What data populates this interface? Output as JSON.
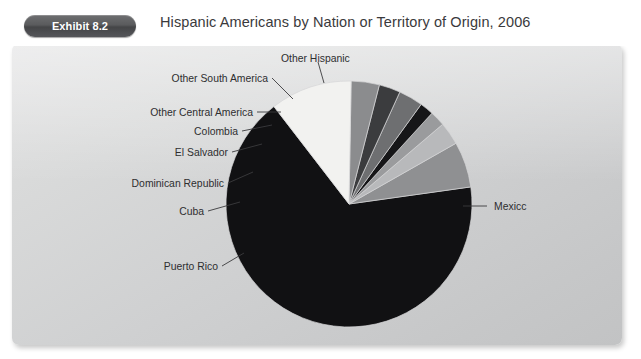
{
  "header": {
    "badge_label": "Exhibit 8.2",
    "title": "Hispanic Americans by Nation or Territory of Origin, 2006"
  },
  "labels": {
    "mexico": "Mexicc",
    "other_hispanic": "Other Hispanic",
    "other_south_america": "Other South America",
    "other_central_america": "Other Central America",
    "colombia": "Colombia",
    "el_salvador": "El  Salvador",
    "dominican_republic": "Dominican Republic",
    "cuba": "Cuba",
    "puerto_rico": "Puerto Rico"
  },
  "colors": {
    "panel_light": "#e0e0e1",
    "panel_dark": "#c2c3c4",
    "badge_dark": "#4a4b4d",
    "title_text": "#3a3a3c",
    "label_text": "#2e2e30",
    "slice_mexico": "#111113",
    "slice_other_hispanic": "#8f9092",
    "slice_other_south_america": "#b8b9bb",
    "slice_other_central_america": "#9a9b9d",
    "slice_colombia": "#161618",
    "slice_el_salvador": "#6e6f71",
    "slice_dominican_republic": "#3b3c3e",
    "slice_cuba": "#8b8c8e",
    "slice_puerto_rico": "#f2f2f0"
  },
  "chart_data": {
    "type": "pie",
    "title": "Hispanic Americans by Nation or Territory of Origin, 2006",
    "legend": "leader-labels",
    "grid": false,
    "units": "percent",
    "categories": [
      "Mexico",
      "Other Hispanic",
      "Other South America",
      "Other Central America",
      "Colombia",
      "El Salvador",
      "Dominican Republic",
      "Cuba",
      "Puerto Rico"
    ],
    "values": [
      64.0,
      6.0,
      3.0,
      2.0,
      1.8,
      3.2,
      2.8,
      3.7,
      13.5
    ],
    "slices": [
      {
        "name": "Mexico",
        "value": 64.0,
        "color": "#111113",
        "start_deg": 352,
        "end_deg": 592.4
      },
      {
        "name": "Other Hispanic",
        "value": 6.0,
        "color": "#8f9092",
        "start_deg": 330.4,
        "end_deg": 352.0
      },
      {
        "name": "Other South America",
        "value": 3.0,
        "color": "#b8b9bb",
        "start_deg": 319.6,
        "end_deg": 330.4
      },
      {
        "name": "Other Central America",
        "value": 2.0,
        "color": "#9a9b9d",
        "start_deg": 312.4,
        "end_deg": 319.6
      },
      {
        "name": "Colombia",
        "value": 1.8,
        "color": "#161618",
        "start_deg": 305.9,
        "end_deg": 312.4
      },
      {
        "name": "El Salvador",
        "value": 3.2,
        "color": "#6e6f71",
        "start_deg": 294.4,
        "end_deg": 305.9
      },
      {
        "name": "Dominican Republic",
        "value": 2.8,
        "color": "#3b3c3e",
        "start_deg": 284.3,
        "end_deg": 294.4
      },
      {
        "name": "Cuba",
        "value": 3.7,
        "color": "#8b8c8e",
        "start_deg": 271.0,
        "end_deg": 284.3
      },
      {
        "name": "Puerto Rico",
        "value": 13.5,
        "color": "#f2f2f0",
        "start_deg": 232.4,
        "end_deg": 271.0
      }
    ],
    "center": {
      "x": 349,
      "y": 204
    },
    "radius": 123
  }
}
